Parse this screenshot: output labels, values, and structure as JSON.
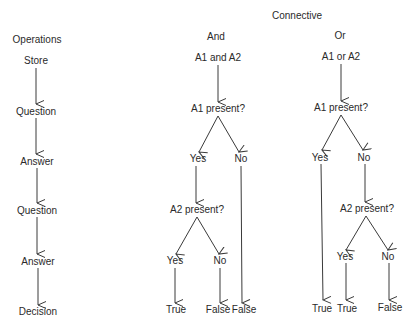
{
  "diagram": {
    "title": "Connective",
    "operations": {
      "heading": "Operations",
      "steps": [
        "Store",
        "Question",
        "Answer",
        "Question",
        "Answer",
        "Decision"
      ]
    },
    "and_column": {
      "heading": "And",
      "store": "A1 and A2",
      "question1": "A1 present?",
      "answer1_yes": "Yes",
      "answer1_no": "No",
      "question2": "A2 present?",
      "answer2_yes": "Yes",
      "answer2_no": "No",
      "decision_yes_yes": "True",
      "decision_yes_no": "False",
      "decision_no": "False"
    },
    "or_column": {
      "heading": "Or",
      "store": "A1 or A2",
      "question1": "A1 present?",
      "answer1_yes": "Yes",
      "answer1_no": "No",
      "question2": "A2 present?",
      "answer2_yes": "Yes",
      "answer2_no": "No",
      "decision_yes": "True",
      "decision_no_yes": "True",
      "decision_no_no": "False"
    },
    "colors": {
      "line": "#3a3a3a",
      "text": "#2a2a2a",
      "background": "#ffffff"
    }
  }
}
